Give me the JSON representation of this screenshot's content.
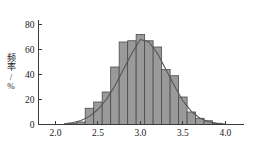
{
  "chart_data": {
    "type": "bar",
    "title": "",
    "subtitle": "",
    "xlabel": "",
    "ylabel": "频率/%",
    "xlim": [
      1.8,
      4.22
    ],
    "ylim": [
      0,
      84
    ],
    "grid": false,
    "legend": "none",
    "bin_width": 0.1,
    "x_ticks": [
      "2.0",
      "2.5",
      "3.0",
      "3.5",
      "4.0"
    ],
    "x_tick_values": [
      2.0,
      2.5,
      3.0,
      3.5,
      4.0
    ],
    "y_ticks": [
      "0",
      "20",
      "40",
      "60",
      "80"
    ],
    "y_tick_values": [
      0,
      20,
      40,
      60,
      80
    ],
    "bin_edges": [
      2.15,
      2.25,
      2.35,
      2.45,
      2.55,
      2.65,
      2.75,
      2.85,
      2.95,
      3.05,
      3.15,
      3.25,
      3.35,
      3.45,
      3.55,
      3.65,
      3.75,
      3.85,
      3.95
    ],
    "categories": [
      "2.15-2.25",
      "2.25-2.35",
      "2.35-2.45",
      "2.45-2.55",
      "2.55-2.65",
      "2.65-2.75",
      "2.75-2.85",
      "2.85-2.95",
      "2.95-3.05",
      "3.05-3.15",
      "3.15-3.25",
      "3.25-3.35",
      "3.35-3.45",
      "3.45-3.55",
      "3.55-3.65",
      "3.65-3.75",
      "3.75-3.85",
      "3.85-3.95"
    ],
    "values": [
      1,
      2,
      13,
      18,
      26,
      46,
      66,
      67,
      72,
      67,
      62,
      44,
      39,
      22,
      10,
      5,
      3,
      1
    ],
    "curve_label": "normal-distribution-fit",
    "curve_points": [
      {
        "x": 2.1,
        "y": 0.6
      },
      {
        "x": 2.2,
        "y": 1.4
      },
      {
        "x": 2.3,
        "y": 3.2
      },
      {
        "x": 2.4,
        "y": 6.5
      },
      {
        "x": 2.5,
        "y": 12.0
      },
      {
        "x": 2.6,
        "y": 20.0
      },
      {
        "x": 2.7,
        "y": 31.0
      },
      {
        "x": 2.8,
        "y": 44.0
      },
      {
        "x": 2.9,
        "y": 57.0
      },
      {
        "x": 3.0,
        "y": 68.0
      },
      {
        "x": 3.1,
        "y": 66.0
      },
      {
        "x": 3.2,
        "y": 57.0
      },
      {
        "x": 3.3,
        "y": 44.0
      },
      {
        "x": 3.4,
        "y": 31.0
      },
      {
        "x": 3.5,
        "y": 19.0
      },
      {
        "x": 3.6,
        "y": 10.5
      },
      {
        "x": 3.7,
        "y": 5.0
      },
      {
        "x": 3.8,
        "y": 2.2
      },
      {
        "x": 3.9,
        "y": 0.9
      },
      {
        "x": 4.0,
        "y": 0.3
      }
    ]
  }
}
